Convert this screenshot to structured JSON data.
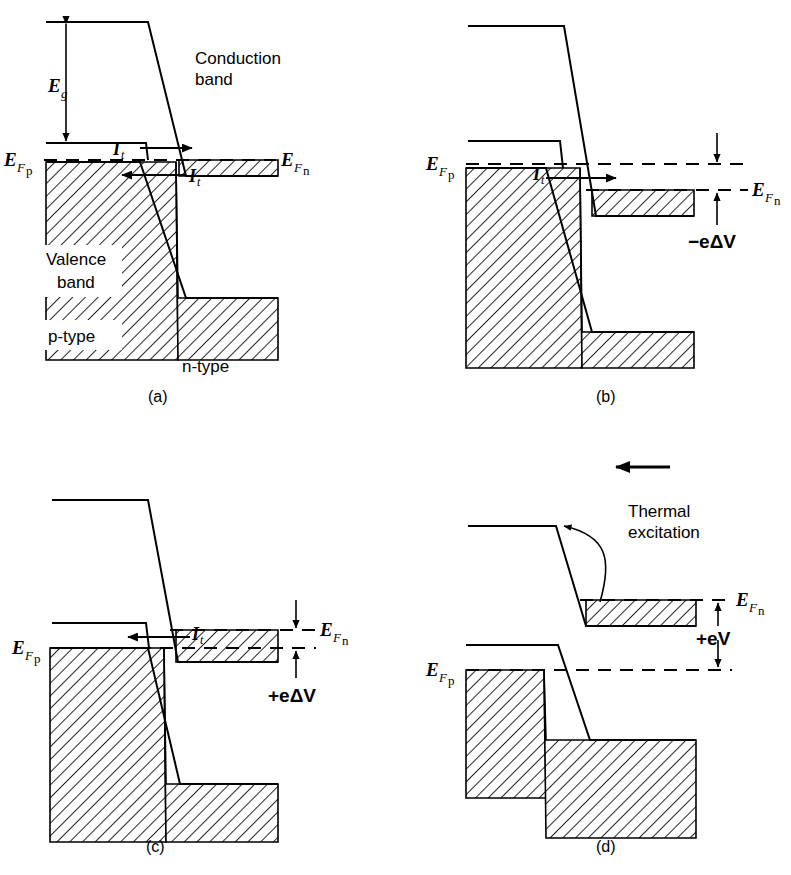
{
  "figure": {
    "background_color": "#ffffff",
    "ink_color": "#000000"
  },
  "panels": [
    {
      "id": "a",
      "caption": "(a)",
      "labels": {
        "band_gap": "E",
        "band_gap_sub": "g",
        "conduction_band_line1": "Conduction",
        "conduction_band_line2": "band",
        "valence_band_line1": "Valence",
        "valence_band_line2": "band",
        "p_type": "p-type",
        "n_type": "n-type",
        "fermi_p": "E",
        "fermi_p_sub_f": "F",
        "fermi_p_sub_type": "p",
        "fermi_n": "E",
        "fermi_n_sub_f": "F",
        "fermi_n_sub_type": "n",
        "tunnel_current_upper": "I",
        "tunnel_current_upper_sub": "t",
        "tunnel_current_lower": "I",
        "tunnel_current_lower_sub": "t"
      }
    },
    {
      "id": "b",
      "caption": "(b)",
      "labels": {
        "fermi_p": "E",
        "fermi_p_sub_f": "F",
        "fermi_p_sub_type": "p",
        "fermi_n": "E",
        "fermi_n_sub_f": "F",
        "fermi_n_sub_type": "n",
        "tunnel_current": "I",
        "tunnel_current_sub": "t",
        "bias": "−eΔV"
      }
    },
    {
      "id": "c",
      "caption": "(c)",
      "labels": {
        "fermi_p": "E",
        "fermi_p_sub_f": "F",
        "fermi_p_sub_type": "p",
        "fermi_n": "E",
        "fermi_n_sub_f": "F",
        "fermi_n_sub_type": "n",
        "tunnel_current": "I",
        "tunnel_current_sub": "t",
        "bias": "+eΔV"
      }
    },
    {
      "id": "d",
      "caption": "(d)",
      "labels": {
        "fermi_p": "E",
        "fermi_p_sub_f": "F",
        "fermi_p_sub_type": "p",
        "fermi_n": "E",
        "fermi_n_sub_f": "F",
        "fermi_n_sub_type": "n",
        "thermal_line1": "Thermal",
        "thermal_line2": "excitation",
        "bias": "+eV"
      }
    }
  ]
}
